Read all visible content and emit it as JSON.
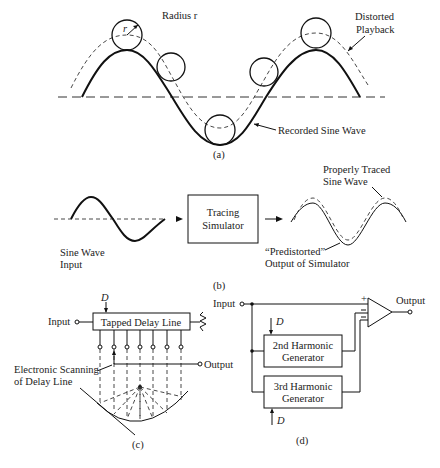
{
  "figure": {
    "panel_a": {
      "caption": "(a)",
      "radius_label": "Radius r",
      "radius_symbol": "r",
      "distorted_label_line1": "Distorted",
      "distorted_label_line2": "Playback",
      "recorded_label": "Recorded Sine Wave"
    },
    "panel_b": {
      "caption": "(b)",
      "input_label_line1": "Sine Wave",
      "input_label_line2": "Input",
      "box_line1": "Tracing",
      "box_line2": "Simulator",
      "proper_label_line1": "Properly Traced",
      "proper_label_line2": "Sine Wave",
      "predistorted_line1": "“Predistorted”",
      "predistorted_line2": "Output of Simulator"
    },
    "panel_c": {
      "caption": "(c)",
      "input_label": "Input",
      "output_label": "Output",
      "delay_symbol": "D",
      "box_label": "Tapped Delay Line",
      "scan_line1": "Electronic Scanning",
      "scan_line2": "of Delay Line"
    },
    "panel_d": {
      "caption": "(d)",
      "input_label": "Input",
      "output_label": "Output",
      "delay_symbol_top": "D",
      "delay_symbol_bottom": "D",
      "gen2_line1": "2nd Harmonic",
      "gen2_line2": "Generator",
      "gen3_line1": "3rd Harmonic",
      "gen3_line2": "Generator",
      "plus_sign": "+",
      "minus_sign": "−"
    }
  }
}
